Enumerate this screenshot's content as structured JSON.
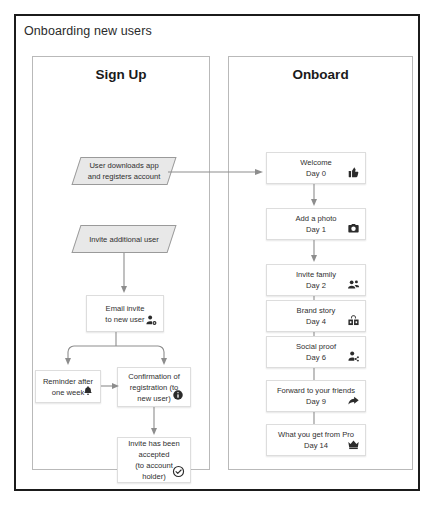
{
  "diagram": {
    "title": "Onboarding new users"
  },
  "lanes": [
    {
      "id": "signup",
      "title": "Sign Up"
    },
    {
      "id": "onboard",
      "title": "Onboard"
    }
  ],
  "signup_nodes": [
    {
      "id": "downloads",
      "shape": "parallelogram",
      "text": "User downloads app\nand registers account",
      "icon": ""
    },
    {
      "id": "invite-additional",
      "shape": "parallelogram",
      "text": "Invite additional user",
      "icon": ""
    },
    {
      "id": "email-invite",
      "shape": "box",
      "text": "Email invite\nto new user",
      "icon": "person-add-icon"
    },
    {
      "id": "reminder",
      "shape": "box",
      "text": "Reminder after\none week",
      "icon": "bell-icon"
    },
    {
      "id": "confirmation",
      "shape": "box",
      "text": "Confirmation of\nregistration (to\nnew user)",
      "icon": "info-icon"
    },
    {
      "id": "accepted",
      "shape": "box",
      "text": "Invite has been\naccepted\n(to account\nholder)",
      "icon": "check-circle-icon"
    }
  ],
  "onboard_nodes": [
    {
      "id": "welcome",
      "title": "Welcome",
      "day": "Day 0",
      "icon": "thumbs-up-icon"
    },
    {
      "id": "photo",
      "title": "Add a photo",
      "day": "Day 1",
      "icon": "camera-icon"
    },
    {
      "id": "family",
      "title": "Invite family",
      "day": "Day 2",
      "icon": "people-add-icon"
    },
    {
      "id": "brand",
      "title": "Brand story",
      "day": "Day 4",
      "icon": "store-icon"
    },
    {
      "id": "social",
      "title": "Social proof",
      "day": "Day 6",
      "icon": "share-person-icon"
    },
    {
      "id": "forward",
      "title": "Forward to your friends",
      "day": "Day 9",
      "icon": "arrow-forward-icon"
    },
    {
      "id": "pro",
      "title": "What you get from Pro",
      "day": "Day 14",
      "icon": "crown-icon"
    }
  ],
  "colors": {
    "frame": "#1b1b1b",
    "lane_border": "#b9b9b9",
    "node_border": "#dddddd",
    "parallelogram_fill": "#e8e8e8",
    "connector": "#8d8d8d",
    "text": "#2f2f2f"
  }
}
